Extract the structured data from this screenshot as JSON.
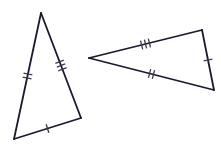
{
  "figure": {
    "background_color": "#ffffff",
    "stroke_color": "#1a1a2e",
    "tick_color": "#3a3a4a",
    "edge_stroke_width": 1.8,
    "tick_stroke_width": 1.3,
    "tick_length": 9,
    "tick_spacing": 4
  },
  "chart_data": {
    "type": "diagram",
    "shapes": [
      {
        "name": "left-triangle",
        "vertices": [
          {
            "label": "apex",
            "x": 41,
            "y": 13
          },
          {
            "label": "bottom-left",
            "x": 14,
            "y": 139
          },
          {
            "label": "bottom-right",
            "x": 81,
            "y": 118
          }
        ],
        "edges": [
          {
            "name": "left-edge",
            "from": "apex",
            "to": "bottom-left",
            "ticks": 2
          },
          {
            "name": "right-edge",
            "from": "apex",
            "to": "bottom-right",
            "ticks": 3
          },
          {
            "name": "bottom-edge",
            "from": "bottom-left",
            "to": "bottom-right",
            "ticks": 1
          }
        ]
      },
      {
        "name": "right-triangle",
        "vertices": [
          {
            "label": "left-point",
            "x": 89,
            "y": 58
          },
          {
            "label": "top-right",
            "x": 202,
            "y": 30
          },
          {
            "label": "bottom-right",
            "x": 214,
            "y": 90
          }
        ],
        "edges": [
          {
            "name": "top-edge",
            "from": "left-point",
            "to": "top-right",
            "ticks": 3
          },
          {
            "name": "bottom-edge",
            "from": "left-point",
            "to": "bottom-right",
            "ticks": 2
          },
          {
            "name": "right-edge",
            "from": "top-right",
            "to": "bottom-right",
            "ticks": 1
          }
        ]
      }
    ]
  }
}
